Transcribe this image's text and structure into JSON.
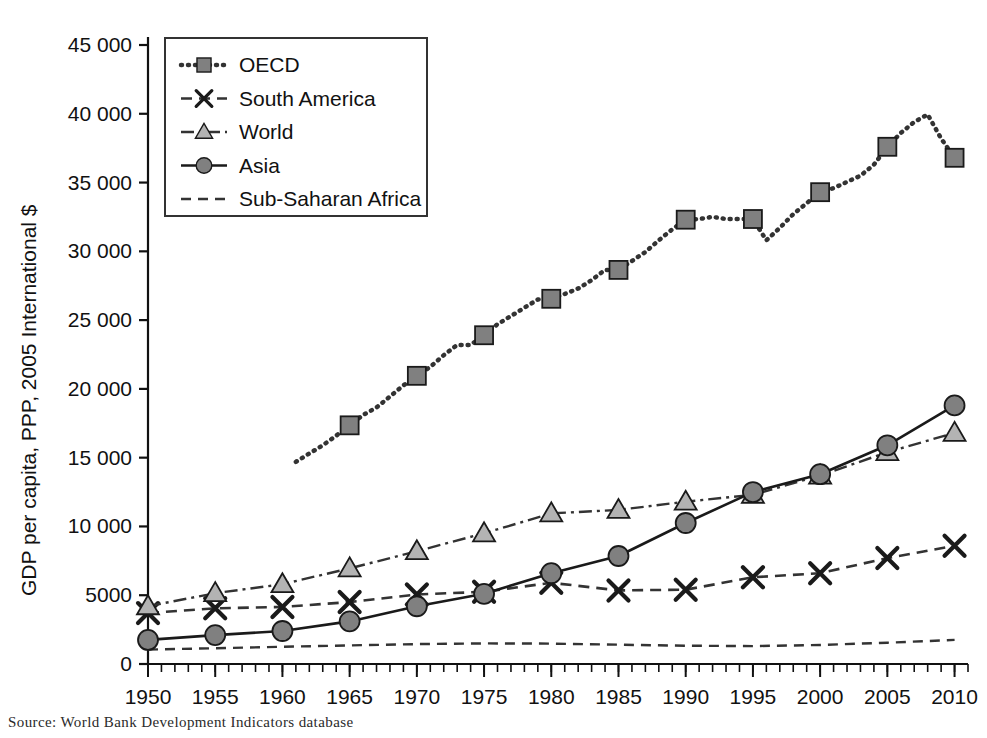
{
  "figure": {
    "source_note": "Source:   World Bank Development Indicators database"
  },
  "chart_data": {
    "type": "line",
    "title": "",
    "xlabel": "",
    "ylabel": "GDP per capita, PPP, 2005 International $",
    "xlim": [
      1950,
      2011
    ],
    "ylim": [
      0,
      45000
    ],
    "xticks": [
      "1950",
      "1955",
      "1960",
      "1965",
      "1970",
      "1975",
      "1980",
      "1985",
      "1990",
      "1995",
      "2000",
      "2005",
      "2010"
    ],
    "xtick_values": [
      1950,
      1955,
      1960,
      1965,
      1970,
      1975,
      1980,
      1985,
      1990,
      1995,
      2000,
      2005,
      2010
    ],
    "xminor_step": 1,
    "yticks": [
      "0",
      "5000",
      "10 000",
      "15 000",
      "20 000",
      "25 000",
      "30 000",
      "35 000",
      "40 000",
      "45 000"
    ],
    "ytick_values": [
      0,
      5000,
      10000,
      15000,
      20000,
      25000,
      30000,
      35000,
      40000,
      45000
    ],
    "grid": false,
    "legend_position": "top-left",
    "marker_years": [
      1950,
      1955,
      1960,
      1965,
      1970,
      1975,
      1980,
      1985,
      1990,
      1995,
      2000,
      2005,
      2010
    ],
    "series": [
      {
        "name": "OECD",
        "color": "#808080",
        "line_color": "#333333",
        "marker": "square",
        "dash": "dotted",
        "x": [
          1961,
          1962,
          1963,
          1964,
          1965,
          1966,
          1967,
          1968,
          1969,
          1970,
          1971,
          1972,
          1973,
          1974,
          1975,
          1976,
          1977,
          1978,
          1979,
          1980,
          1981,
          1982,
          1983,
          1984,
          1985,
          1986,
          1987,
          1988,
          1989,
          1990,
          1991,
          1992,
          1993,
          1994,
          1995,
          1996,
          1997,
          1998,
          1999,
          2000,
          2001,
          2002,
          2003,
          2004,
          2005,
          2006,
          2007,
          2008,
          2009,
          2010
        ],
        "values": [
          14700,
          15300,
          15900,
          16600,
          17350,
          18100,
          18650,
          19450,
          20250,
          20950,
          21600,
          22450,
          23200,
          23200,
          23900,
          24700,
          25300,
          25900,
          26500,
          26550,
          26900,
          27300,
          27900,
          28650,
          28650,
          29300,
          29950,
          30800,
          31600,
          32300,
          32350,
          32500,
          32350,
          32350,
          32350,
          30800,
          31700,
          32700,
          33500,
          34300,
          34600,
          35050,
          35500,
          36300,
          37600,
          38600,
          39400,
          39950,
          38200,
          36800
        ]
      },
      {
        "name": "South America",
        "color": "#404040",
        "line_color": "#333333",
        "marker": "x-cross",
        "dash": "dashed",
        "x": [
          1950,
          1955,
          1960,
          1965,
          1970,
          1975,
          1980,
          1985,
          1990,
          1995,
          2000,
          2005,
          2010
        ],
        "values": [
          3700,
          4050,
          4150,
          4500,
          5050,
          5250,
          5900,
          5350,
          5400,
          6300,
          6600,
          7700,
          8600
        ]
      },
      {
        "name": "World",
        "color": "#b3b3b3",
        "line_color": "#333333",
        "marker": "triangle",
        "dash": "dash-dot",
        "x": [
          1950,
          1955,
          1960,
          1965,
          1970,
          1975,
          1980,
          1985,
          1990,
          1995,
          2000,
          2005,
          2010
        ],
        "values": [
          4200,
          5150,
          5800,
          6950,
          8200,
          9500,
          10950,
          11200,
          11800,
          12300,
          13700,
          15400,
          16800
        ]
      },
      {
        "name": "Asia",
        "color": "#808080",
        "line_color": "#1a1a1a",
        "marker": "circle",
        "dash": "solid",
        "x": [
          1950,
          1955,
          1960,
          1965,
          1970,
          1975,
          1980,
          1985,
          1990,
          1995,
          2000,
          2005,
          2010
        ],
        "values": [
          1750,
          2100,
          2400,
          3100,
          4200,
          5100,
          6600,
          7850,
          10250,
          12500,
          13800,
          15900,
          18800
        ]
      },
      {
        "name": "Sub-Saharan Africa",
        "color": "#333333",
        "line_color": "#333333",
        "marker": "none",
        "dash": "dashed-thin",
        "x": [
          1950,
          1955,
          1960,
          1965,
          1970,
          1975,
          1980,
          1985,
          1990,
          1995,
          2000,
          2005,
          2010
        ],
        "values": [
          1050,
          1150,
          1250,
          1350,
          1450,
          1500,
          1480,
          1400,
          1330,
          1300,
          1380,
          1550,
          1750
        ]
      }
    ],
    "legend": [
      {
        "label": "OECD",
        "marker": "square",
        "dash": "dotted",
        "fill": "#808080"
      },
      {
        "label": "South America",
        "marker": "x-cross",
        "dash": "dashed",
        "fill": "#404040"
      },
      {
        "label": "World",
        "marker": "triangle",
        "dash": "dash-dot",
        "fill": "#b3b3b3"
      },
      {
        "label": "Asia",
        "marker": "circle",
        "dash": "solid",
        "fill": "#808080"
      },
      {
        "label": "Sub-Saharan Africa",
        "marker": "none",
        "dash": "dashed-thin",
        "fill": "none"
      }
    ]
  }
}
